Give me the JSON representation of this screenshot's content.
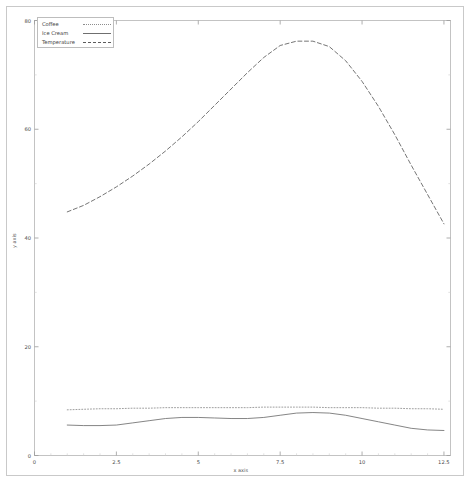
{
  "chart_data": {
    "type": "line",
    "title": "",
    "xlabel": "x axis",
    "ylabel": "y axis",
    "xlim": [
      0,
      12.7
    ],
    "ylim": [
      0,
      80
    ],
    "grid": false,
    "legend_position": "upper left",
    "xticks": [
      "0",
      "2.5",
      "5",
      "7.5",
      "10",
      "12.5"
    ],
    "xtick_values": [
      0,
      2.5,
      5,
      7.5,
      10,
      12.5
    ],
    "yticks": [
      "0",
      "20",
      "40",
      "60",
      "80"
    ],
    "ytick_values": [
      0,
      20,
      40,
      60,
      80
    ],
    "x": [
      1.0,
      1.5,
      2.0,
      2.5,
      3.0,
      3.5,
      4.0,
      4.5,
      5.0,
      5.5,
      6.0,
      6.5,
      7.0,
      7.5,
      8.0,
      8.5,
      9.0,
      9.5,
      10.0,
      10.5,
      11.0,
      11.5,
      12.0,
      12.5
    ],
    "series": [
      {
        "name": "Coffee",
        "style": "dotted",
        "color": "#8d8d8d",
        "values": [
          8.4,
          8.5,
          8.6,
          8.6,
          8.7,
          8.7,
          8.8,
          8.8,
          8.8,
          8.8,
          8.8,
          8.8,
          8.9,
          8.9,
          8.9,
          8.9,
          8.8,
          8.8,
          8.8,
          8.7,
          8.7,
          8.6,
          8.6,
          8.5
        ]
      },
      {
        "name": "Ice Cream",
        "style": "solid",
        "color": "#6f6f6f",
        "values": [
          5.6,
          5.5,
          5.5,
          5.6,
          6.0,
          6.4,
          6.8,
          7.0,
          7.0,
          6.9,
          6.8,
          6.8,
          7.0,
          7.4,
          7.8,
          7.9,
          7.8,
          7.4,
          6.8,
          6.2,
          5.6,
          5.0,
          4.7,
          4.6
        ]
      },
      {
        "name": "Temperature",
        "style": "dashed",
        "color": "#5c5c5c",
        "values": [
          44.8,
          46.0,
          47.6,
          49.4,
          51.4,
          53.6,
          56.0,
          58.6,
          61.4,
          64.4,
          67.4,
          70.4,
          73.2,
          75.4,
          76.2,
          76.2,
          75.2,
          72.6,
          68.8,
          64.2,
          59.0,
          53.4,
          48.0,
          42.6
        ]
      }
    ]
  },
  "legend": {
    "entries": [
      {
        "label": "Coffee"
      },
      {
        "label": "Ice Cream"
      },
      {
        "label": "Temperature"
      }
    ]
  }
}
